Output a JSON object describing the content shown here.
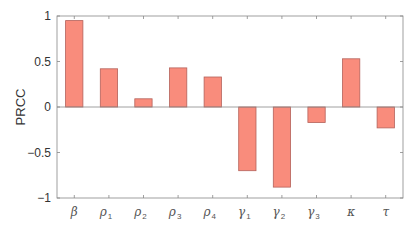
{
  "chart_data": {
    "type": "bar",
    "title": "",
    "xlabel": "",
    "ylabel": "PRCC",
    "ylim": [
      -1,
      1
    ],
    "yticks": [
      -1,
      -0.5,
      0,
      0.5,
      1
    ],
    "ytick_labels": [
      "−1",
      "−0.5",
      "0",
      "0.5",
      "1"
    ],
    "grid": false,
    "legend": null,
    "categories": [
      "β",
      "ρ1",
      "ρ2",
      "ρ3",
      "ρ4",
      "γ1",
      "γ2",
      "γ3",
      "κ",
      "τ"
    ],
    "category_labels": [
      {
        "base": "β",
        "sub": ""
      },
      {
        "base": "ρ",
        "sub": "1"
      },
      {
        "base": "ρ",
        "sub": "2"
      },
      {
        "base": "ρ",
        "sub": "3"
      },
      {
        "base": "ρ",
        "sub": "4"
      },
      {
        "base": "γ",
        "sub": "1"
      },
      {
        "base": "γ",
        "sub": "2"
      },
      {
        "base": "γ",
        "sub": "3"
      },
      {
        "base": "κ",
        "sub": ""
      },
      {
        "base": "τ",
        "sub": ""
      }
    ],
    "values": [
      0.95,
      0.42,
      0.09,
      0.43,
      0.33,
      -0.7,
      -0.88,
      -0.17,
      0.53,
      -0.23
    ],
    "colors": {
      "bar_fill": "#F98C7C",
      "bar_edge": "#B4625A",
      "axis": "#888888",
      "zero_line": "#888888"
    }
  }
}
